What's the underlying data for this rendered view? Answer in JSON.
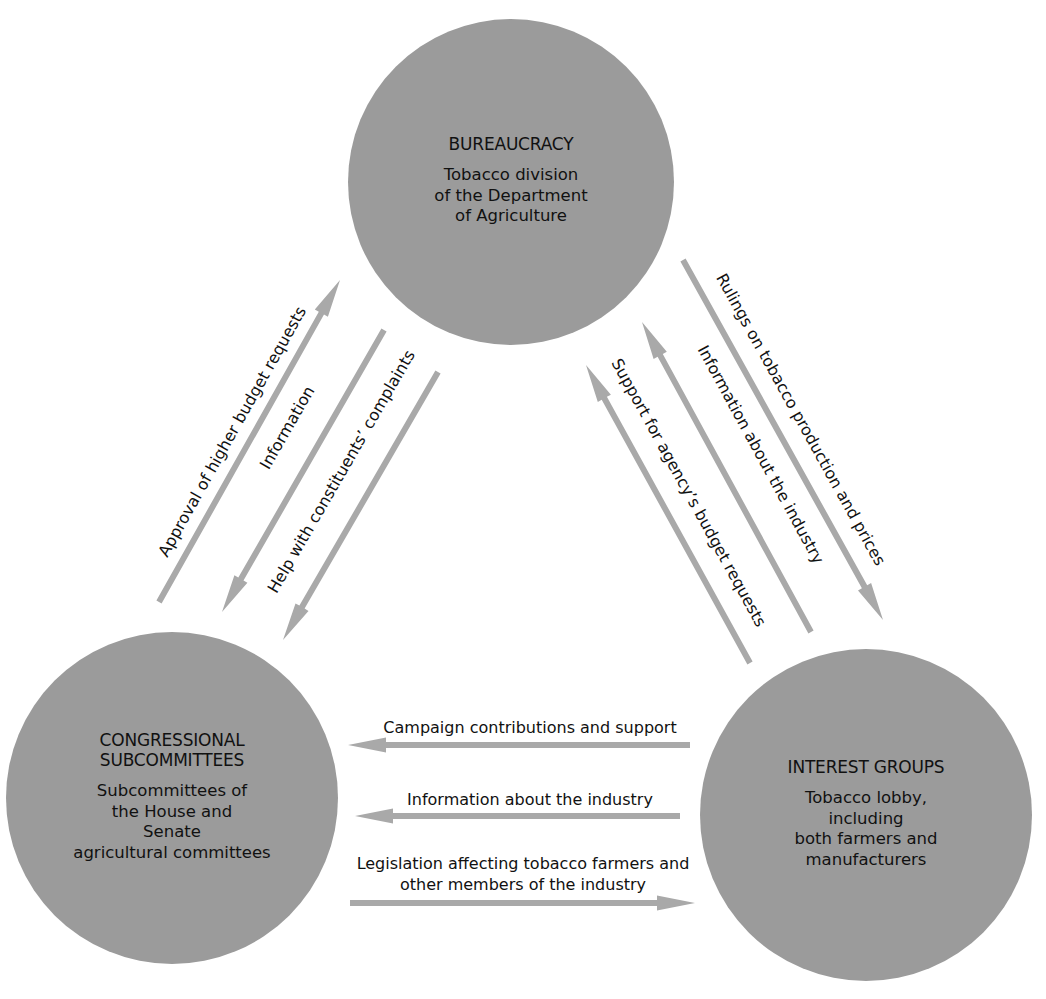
{
  "diagram": {
    "type": "iron-triangle",
    "colors": {
      "background": "#ffffff",
      "node_fill": "#9b9b9b",
      "arrow": "#a9a9a9",
      "text": "#111111"
    },
    "nodes": [
      {
        "id": "bureaucracy",
        "title": [
          "BUREAUCRACY"
        ],
        "description": [
          "Tobacco division",
          "of the Department",
          "of Agriculture"
        ],
        "cx": 511,
        "cy": 182,
        "r": 163
      },
      {
        "id": "congressional-subcommittees",
        "title": [
          "CONGRESSIONAL",
          "SUBCOMMITTEES"
        ],
        "description": [
          "Subcommittees of",
          "the House and",
          "Senate",
          "agricultural committees"
        ],
        "cx": 172,
        "cy": 798,
        "r": 166
      },
      {
        "id": "interest-groups",
        "title": [
          "INTEREST GROUPS"
        ],
        "description": [
          "Tobacco lobby,",
          "including",
          "both farmers and",
          "manufacturers"
        ],
        "cx": 866,
        "cy": 815,
        "r": 166
      }
    ],
    "edges": [
      {
        "id": "approval-budget",
        "from": "congressional-subcommittees",
        "to": "bureaucracy",
        "label": "Approval of higher budget requests",
        "x1": 159,
        "y1": 602,
        "x2": 340,
        "y2": 280,
        "label_x": 233,
        "label_y": 432
      },
      {
        "id": "information-to-congress",
        "from": "bureaucracy",
        "to": "congressional-subcommittees",
        "label": "Information",
        "x1": 384,
        "y1": 330,
        "x2": 222,
        "y2": 612,
        "label_x": 288,
        "label_y": 428
      },
      {
        "id": "help-constituents",
        "from": "bureaucracy",
        "to": "congressional-subcommittees",
        "label": "Help with constituents’ complaints",
        "x1": 438,
        "y1": 372,
        "x2": 283,
        "y2": 640,
        "label_x": 342,
        "label_y": 472
      },
      {
        "id": "rulings-tobacco",
        "from": "bureaucracy",
        "to": "interest-groups",
        "label": "Rulings on tobacco production and prices",
        "x1": 683,
        "y1": 260,
        "x2": 883,
        "y2": 620,
        "label_x": 800,
        "label_y": 420
      },
      {
        "id": "information-industry-to-bureaucracy",
        "from": "interest-groups",
        "to": "bureaucracy",
        "label": "Information about the industry",
        "x1": 811,
        "y1": 632,
        "x2": 642,
        "y2": 322,
        "label_x": 760,
        "label_y": 455
      },
      {
        "id": "support-agency-budget",
        "from": "interest-groups",
        "to": "bureaucracy",
        "label": "Support for agency’s budget requests",
        "x1": 750,
        "y1": 663,
        "x2": 586,
        "y2": 365,
        "label_x": 688,
        "label_y": 493
      },
      {
        "id": "campaign-contributions",
        "from": "interest-groups",
        "to": "congressional-subcommittees",
        "label": "Campaign contributions and support",
        "x1": 690,
        "y1": 745,
        "x2": 348,
        "y2": 745,
        "label_x": 530,
        "label_y": 728
      },
      {
        "id": "information-industry-to-congress",
        "from": "interest-groups",
        "to": "congressional-subcommittees",
        "label": "Information about the industry",
        "x1": 680,
        "y1": 816,
        "x2": 355,
        "y2": 816,
        "label_x": 530,
        "label_y": 800
      },
      {
        "id": "legislation-affecting",
        "from": "congressional-subcommittees",
        "to": "interest-groups",
        "label": [
          "Legislation affecting tobacco farmers and",
          "other members of the industry"
        ],
        "x1": 350,
        "y1": 903,
        "x2": 695,
        "y2": 903,
        "label_x": 523,
        "label_y": 864
      }
    ]
  }
}
